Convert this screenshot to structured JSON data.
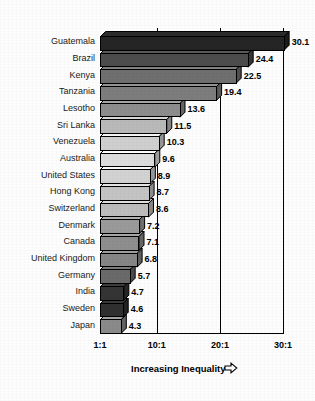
{
  "chart_data": {
    "type": "bar",
    "orientation": "horizontal",
    "title": "",
    "subtitle": "",
    "xlabel": "Increasing Inequality",
    "ylabel": "",
    "xlim": [
      1,
      31
    ],
    "grid": true,
    "legend": null,
    "xtick_labels": [
      "1:1",
      "10:1",
      "20:1",
      "30:1"
    ],
    "xtick_values": [
      1,
      10,
      20,
      30
    ],
    "value_suffix": "",
    "categories": [
      "Guatemala",
      "Brazil",
      "Kenya",
      "Tanzania",
      "Lesotho",
      "Sri Lanka",
      "Venezuela",
      "Australia",
      "United States",
      "Hong Kong",
      "Switzerland",
      "Denmark",
      "Canada",
      "United Kingdom",
      "Germany",
      "India",
      "Sweden",
      "Japan"
    ],
    "values": [
      30.1,
      24.4,
      22.5,
      19.4,
      13.6,
      11.5,
      10.3,
      9.6,
      8.9,
      8.7,
      8.6,
      7.2,
      7.1,
      6.8,
      5.7,
      4.7,
      4.6,
      4.3
    ],
    "value_labels": [
      "30.1",
      "24.4",
      "22.5",
      "19.4",
      "13.6",
      "11.5",
      "10.3",
      "9.6",
      "8.9",
      "8.7",
      "8.6",
      "7.2",
      "7.1",
      "6.8",
      "5.7",
      "4.7",
      "4.6",
      "4.3"
    ],
    "bar_colors": [
      "#252525",
      "#4d4d4d",
      "#6f6f6f",
      "#7d7d7d",
      "#8d8d8d",
      "#b9b9b9",
      "#cfcfcf",
      "#dcdcdc",
      "#d2d2d2",
      "#c4c4c4",
      "#bdbdbd",
      "#9a9a9a",
      "#8e8e8e",
      "#868686",
      "#6a6a6a",
      "#343434",
      "#303030",
      "#8a8a8a"
    ]
  },
  "axis": {
    "title": "Increasing Inequality",
    "arrow_icon": "right-arrow-icon"
  }
}
